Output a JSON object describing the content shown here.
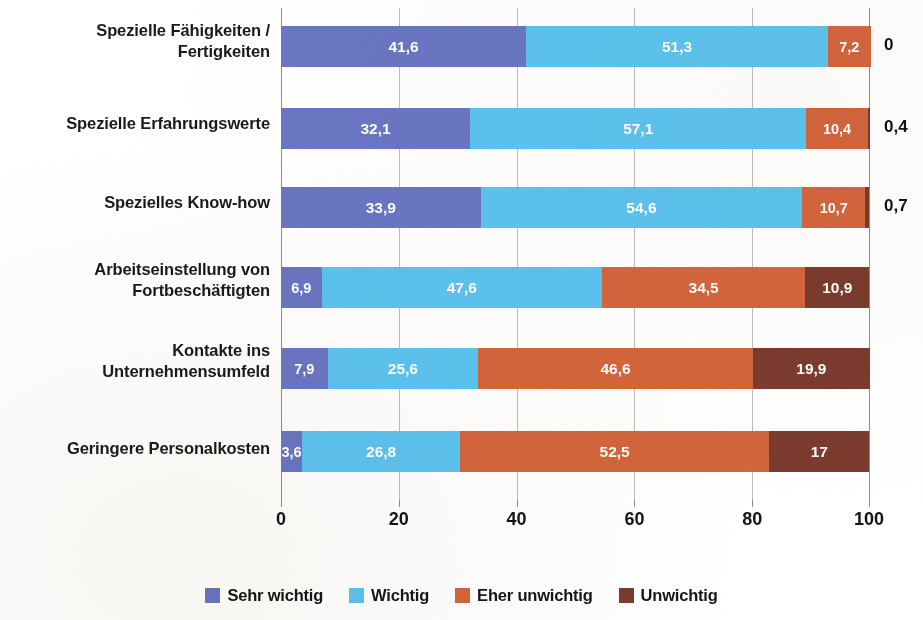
{
  "chart_data": {
    "type": "bar",
    "orientation": "horizontal",
    "stacked": "percent",
    "title": "",
    "subtitle": "",
    "xlabel": "",
    "ylabel": "",
    "xlim": [
      0,
      100
    ],
    "xticks": [
      "0",
      "20",
      "40",
      "60",
      "80",
      "100"
    ],
    "xtick_values": [
      0,
      20,
      40,
      60,
      80,
      100
    ],
    "grid": true,
    "legend_position": "bottom",
    "categories": [
      "Spezielle Fähigkeiten / Fertigkeiten",
      "Spezielle Erfahrungswerte",
      "Spezielles Know-how",
      "Arbeitseinstellung von Fortbeschäftigten",
      "Kontakte ins Unternehmensumfeld",
      "Geringere Personalkosten"
    ],
    "category_lines": [
      [
        "Spezielle Fähigkeiten /",
        "Fertigkeiten"
      ],
      [
        "Spezielle Erfahrungswerte"
      ],
      [
        "Spezielles Know-how"
      ],
      [
        "Arbeitseinstellung von",
        "Fortbeschäftigten"
      ],
      [
        "Kontakte ins",
        "Unternehmensumfeld"
      ],
      [
        "Geringere Personalkosten"
      ]
    ],
    "series": [
      {
        "name": "Sehr wichtig",
        "color": "#6B76C4",
        "values": [
          41.6,
          32.1,
          33.9,
          6.9,
          7.9,
          3.6
        ],
        "labels": [
          "41,6",
          "32,1",
          "33,9",
          "6,9",
          "7,9",
          "3,6"
        ]
      },
      {
        "name": "Wichtig",
        "color": "#5CC3F0",
        "values": [
          51.3,
          57.1,
          54.6,
          47.6,
          25.6,
          26.8
        ],
        "labels": [
          "51,3",
          "57,1",
          "54,6",
          "47,6",
          "25,6",
          "26,8"
        ]
      },
      {
        "name": "Eher unwichtig",
        "color": "#D4653C",
        "values": [
          7.2,
          10.4,
          10.7,
          34.5,
          46.6,
          52.5
        ],
        "labels": [
          "7,2",
          "10,4",
          "10,7",
          "34,5",
          "46,6",
          "52,5"
        ]
      },
      {
        "name": "Unwichtig",
        "color": "#7B3B2E",
        "values": [
          0,
          0.4,
          0.7,
          10.9,
          19.9,
          17
        ],
        "labels": [
          "0",
          "0,4",
          "0,7",
          "10,9",
          "19,9",
          "17"
        ]
      }
    ],
    "outside_labels": [
      "0",
      "0,4",
      "0,7",
      "",
      "",
      ""
    ],
    "colors": {
      "sehr_wichtig": "#6B76C4",
      "wichtig": "#5CC3F0",
      "eher_unwichtig": "#D4653C",
      "unwichtig": "#7B3B2E",
      "gridline": "#bdbdbd",
      "axis": "#8d8d8d",
      "text": "#1a1a1a"
    }
  },
  "legend": {
    "items": [
      {
        "label": "Sehr wichtig",
        "color": "#6B76C4"
      },
      {
        "label": "Wichtig",
        "color": "#5CC3F0"
      },
      {
        "label": "Eher unwichtig",
        "color": "#D4653C"
      },
      {
        "label": "Unwichtig",
        "color": "#7B3B2E"
      }
    ]
  }
}
